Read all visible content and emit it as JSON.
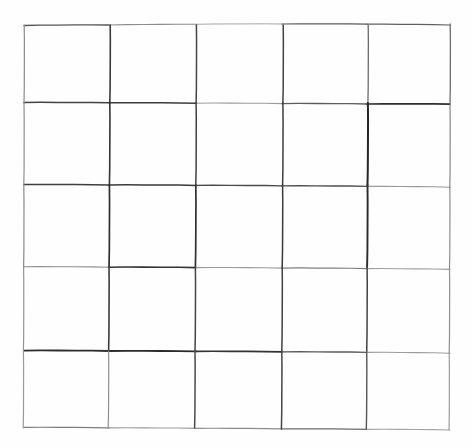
{
  "document": {
    "title": "Hand-drawn 5x5 grid",
    "description": "A blank hand-drawn square grid on white paper",
    "background_color": "#fefefe",
    "ink_color": "#2b2b2b",
    "light_ink_color": "#8a8a8a",
    "canvas": {
      "width": 471,
      "height": 448
    }
  },
  "grid": {
    "rows": 5,
    "columns": 5,
    "cell_count": 25,
    "bounds": {
      "left": 24,
      "top": 25,
      "right": 450,
      "bottom": 429
    },
    "horizontal_lines": [
      {
        "id": "h0",
        "name": "top-border",
        "y_left": 25,
        "y_right": 24,
        "width": 1.2,
        "color": "#6f6f6f",
        "segments": [
          {
            "x1": 24,
            "x2": 109,
            "y1": 25.5,
            "y2": 25.0,
            "width": 1.3,
            "color": "#555555"
          },
          {
            "x1": 109,
            "x2": 196,
            "y1": 25.0,
            "y2": 24.3,
            "width": 1.1,
            "color": "#8d8d8d"
          },
          {
            "x1": 196,
            "x2": 282,
            "y1": 24.3,
            "y2": 24.0,
            "width": 1.0,
            "color": "#a8a8a8"
          },
          {
            "x1": 282,
            "x2": 367,
            "y1": 24.0,
            "y2": 24.2,
            "width": 1.2,
            "color": "#5a5a5a"
          },
          {
            "x1": 367,
            "x2": 450,
            "y1": 24.2,
            "y2": 25.0,
            "width": 1.2,
            "color": "#5f5f5f"
          }
        ]
      },
      {
        "id": "h1",
        "name": "row1-row2-divider",
        "y_left": 103,
        "y_right": 104,
        "width": 1.6,
        "color": "#3a3a3a",
        "segments": [
          {
            "x1": 24,
            "x2": 109,
            "y1": 102.5,
            "y2": 102.8,
            "width": 1.5,
            "color": "#444444"
          },
          {
            "x1": 109,
            "x2": 196,
            "y1": 102.8,
            "y2": 103.2,
            "width": 1.5,
            "color": "#3c3c3c"
          },
          {
            "x1": 196,
            "x2": 282,
            "y1": 103.2,
            "y2": 103.6,
            "width": 1.1,
            "color": "#9c9c9c"
          },
          {
            "x1": 282,
            "x2": 367,
            "y1": 103.6,
            "y2": 104.0,
            "width": 1.3,
            "color": "#5c5c5c"
          },
          {
            "x1": 367,
            "x2": 450,
            "y1": 104.0,
            "y2": 104.2,
            "width": 1.7,
            "color": "#2f2f2f"
          }
        ]
      },
      {
        "id": "h2",
        "name": "row2-row3-divider",
        "y_left": 185,
        "y_right": 187,
        "width": 1.6,
        "color": "#3a3a3a",
        "segments": [
          {
            "x1": 24,
            "x2": 109,
            "y1": 184.5,
            "y2": 185.0,
            "width": 1.5,
            "color": "#3e3e3e"
          },
          {
            "x1": 109,
            "x2": 196,
            "y1": 185.0,
            "y2": 185.4,
            "width": 1.5,
            "color": "#3a3a3a"
          },
          {
            "x1": 196,
            "x2": 282,
            "y1": 185.4,
            "y2": 185.9,
            "width": 1.4,
            "color": "#4a4a4a"
          },
          {
            "x1": 282,
            "x2": 367,
            "y1": 185.9,
            "y2": 186.4,
            "width": 1.4,
            "color": "#4e4e4e"
          },
          {
            "x1": 367,
            "x2": 450,
            "y1": 186.4,
            "y2": 187.2,
            "width": 1.1,
            "color": "#9a9a9a"
          }
        ]
      },
      {
        "id": "h3",
        "name": "row3-row4-divider",
        "y_left": 267,
        "y_right": 269,
        "width": 1.5,
        "color": "#444444",
        "segments": [
          {
            "x1": 24,
            "x2": 109,
            "y1": 266.8,
            "y2": 267.2,
            "width": 1.1,
            "color": "#8e8e8e"
          },
          {
            "x1": 109,
            "x2": 196,
            "y1": 267.2,
            "y2": 267.6,
            "width": 1.6,
            "color": "#333333"
          },
          {
            "x1": 196,
            "x2": 282,
            "y1": 267.6,
            "y2": 268.1,
            "width": 1.1,
            "color": "#9b9b9b"
          },
          {
            "x1": 282,
            "x2": 367,
            "y1": 268.1,
            "y2": 268.6,
            "width": 1.2,
            "color": "#7d7d7d"
          },
          {
            "x1": 367,
            "x2": 450,
            "y1": 268.6,
            "y2": 269.4,
            "width": 1.1,
            "color": "#9f9f9f"
          }
        ]
      },
      {
        "id": "h4",
        "name": "row4-row5-divider",
        "y_left": 351,
        "y_right": 353,
        "width": 1.8,
        "color": "#2e2e2e",
        "segments": [
          {
            "x1": 24,
            "x2": 109,
            "y1": 350.6,
            "y2": 351.0,
            "width": 1.8,
            "color": "#2c2c2c"
          },
          {
            "x1": 109,
            "x2": 196,
            "y1": 351.0,
            "y2": 351.4,
            "width": 1.8,
            "color": "#2a2a2a"
          },
          {
            "x1": 196,
            "x2": 282,
            "y1": 351.4,
            "y2": 351.9,
            "width": 1.7,
            "color": "#333333"
          },
          {
            "x1": 282,
            "x2": 367,
            "y1": 351.9,
            "y2": 352.4,
            "width": 1.4,
            "color": "#5b5b5b"
          },
          {
            "x1": 367,
            "x2": 450,
            "y1": 352.4,
            "y2": 353.2,
            "width": 1.1,
            "color": "#9d9d9d"
          }
        ]
      },
      {
        "id": "h5",
        "name": "bottom-border",
        "y_left": 428,
        "y_right": 430,
        "width": 1.2,
        "color": "#8a8a8a",
        "segments": [
          {
            "x1": 24,
            "x2": 109,
            "y1": 427.4,
            "y2": 427.9,
            "width": 1.2,
            "color": "#7c7c7c"
          },
          {
            "x1": 109,
            "x2": 196,
            "y1": 427.9,
            "y2": 428.4,
            "width": 1.1,
            "color": "#9a9a9a"
          },
          {
            "x1": 196,
            "x2": 282,
            "y1": 428.4,
            "y2": 428.9,
            "width": 1.2,
            "color": "#8b8b8b"
          },
          {
            "x1": 282,
            "x2": 367,
            "y1": 428.9,
            "y2": 429.4,
            "width": 1.3,
            "color": "#6c6c6c"
          },
          {
            "x1": 367,
            "x2": 450,
            "y1": 429.4,
            "y2": 430.0,
            "width": 1.1,
            "color": "#a5a5a5"
          }
        ]
      }
    ],
    "vertical_lines": [
      {
        "id": "v0",
        "name": "left-border",
        "x_top": 24,
        "x_bottom": 23,
        "width": 1.2,
        "color": "#8d8d8d",
        "segments": [
          {
            "y1": 25,
            "y2": 103,
            "x1": 24.2,
            "x2": 24.0,
            "width": 1.2,
            "color": "#8b8b8b"
          },
          {
            "y1": 103,
            "y2": 185,
            "x1": 24.0,
            "x2": 23.8,
            "width": 1.2,
            "color": "#8f8f8f"
          },
          {
            "y1": 185,
            "y2": 267,
            "x1": 23.8,
            "x2": 23.6,
            "width": 1.2,
            "color": "#8a8a8a"
          },
          {
            "y1": 267,
            "y2": 351,
            "x1": 23.6,
            "x2": 23.4,
            "width": 1.2,
            "color": "#949494"
          },
          {
            "y1": 351,
            "y2": 428,
            "x1": 23.4,
            "x2": 23.2,
            "width": 1.2,
            "color": "#9a9a9a"
          }
        ]
      },
      {
        "id": "v1",
        "name": "col1-col2-divider",
        "x_top": 110,
        "x_bottom": 108,
        "width": 1.6,
        "color": "#383838",
        "segments": [
          {
            "y1": 25,
            "y2": 103,
            "x1": 110.2,
            "x2": 109.8,
            "width": 1.6,
            "color": "#3a3a3a"
          },
          {
            "y1": 103,
            "y2": 185,
            "x1": 109.8,
            "x2": 109.4,
            "width": 1.6,
            "color": "#343434"
          },
          {
            "y1": 185,
            "y2": 267,
            "x1": 109.4,
            "x2": 109.0,
            "width": 1.7,
            "color": "#2f2f2f"
          },
          {
            "y1": 267,
            "y2": 351,
            "x1": 109.0,
            "x2": 108.6,
            "width": 1.6,
            "color": "#3b3b3b"
          },
          {
            "y1": 351,
            "y2": 428,
            "x1": 108.6,
            "x2": 108.2,
            "width": 1.2,
            "color": "#909090"
          }
        ]
      },
      {
        "id": "v2",
        "name": "col2-col3-divider",
        "x_top": 196,
        "x_bottom": 195,
        "width": 1.5,
        "color": "#414141",
        "segments": [
          {
            "y1": 25,
            "y2": 103,
            "x1": 196.4,
            "x2": 196.1,
            "width": 1.5,
            "color": "#454545"
          },
          {
            "y1": 103,
            "y2": 185,
            "x1": 196.1,
            "x2": 195.8,
            "width": 1.5,
            "color": "#3f3f3f"
          },
          {
            "y1": 185,
            "y2": 267,
            "x1": 195.8,
            "x2": 195.4,
            "width": 1.7,
            "color": "#303030"
          },
          {
            "y1": 267,
            "y2": 351,
            "x1": 195.4,
            "x2": 195.0,
            "width": 1.5,
            "color": "#444444"
          },
          {
            "y1": 351,
            "y2": 428,
            "x1": 195.0,
            "x2": 194.6,
            "width": 1.5,
            "color": "#4a4a4a"
          }
        ]
      },
      {
        "id": "v3",
        "name": "col3-col4-divider",
        "x_top": 283,
        "x_bottom": 281,
        "width": 1.5,
        "color": "#3e3e3e",
        "segments": [
          {
            "y1": 25,
            "y2": 103,
            "x1": 283.2,
            "x2": 282.9,
            "width": 1.5,
            "color": "#424242"
          },
          {
            "y1": 103,
            "y2": 185,
            "x1": 282.9,
            "x2": 282.6,
            "width": 1.5,
            "color": "#3d3d3d"
          },
          {
            "y1": 185,
            "y2": 267,
            "x1": 282.6,
            "x2": 282.2,
            "width": 1.5,
            "color": "#3a3a3a"
          },
          {
            "y1": 267,
            "y2": 351,
            "x1": 282.2,
            "x2": 281.8,
            "width": 1.5,
            "color": "#404040"
          },
          {
            "y1": 351,
            "y2": 429,
            "x1": 281.8,
            "x2": 281.4,
            "width": 1.5,
            "color": "#454545"
          }
        ]
      },
      {
        "id": "v4",
        "name": "col4-col5-divider",
        "x_top": 368,
        "x_bottom": 366,
        "width": 1.7,
        "color": "#303030",
        "segments": [
          {
            "y1": 25,
            "y2": 103,
            "x1": 368.2,
            "x2": 367.9,
            "width": 1.3,
            "color": "#6a6a6a"
          },
          {
            "y1": 103,
            "y2": 185,
            "x1": 367.9,
            "x2": 367.5,
            "width": 2.0,
            "color": "#262626"
          },
          {
            "y1": 185,
            "y2": 267,
            "x1": 367.5,
            "x2": 367.1,
            "width": 1.9,
            "color": "#2a2a2a"
          },
          {
            "y1": 267,
            "y2": 351,
            "x1": 367.1,
            "x2": 366.7,
            "width": 1.5,
            "color": "#424242"
          },
          {
            "y1": 351,
            "y2": 429,
            "x1": 366.7,
            "x2": 366.3,
            "width": 1.4,
            "color": "#565656"
          }
        ]
      },
      {
        "id": "v5",
        "name": "right-border",
        "x_top": 450,
        "x_bottom": 449,
        "width": 1.2,
        "color": "#7f7f7f",
        "segments": [
          {
            "y1": 24,
            "y2": 104,
            "x1": 450.2,
            "x2": 450.0,
            "width": 1.3,
            "color": "#6d6d6d"
          },
          {
            "y1": 104,
            "y2": 187,
            "x1": 450.0,
            "x2": 449.8,
            "width": 1.2,
            "color": "#858585"
          },
          {
            "y1": 187,
            "y2": 269,
            "x1": 449.8,
            "x2": 449.5,
            "width": 1.2,
            "color": "#8c8c8c"
          },
          {
            "y1": 269,
            "y2": 353,
            "x1": 449.5,
            "x2": 449.2,
            "width": 1.2,
            "color": "#8f8f8f"
          },
          {
            "y1": 353,
            "y2": 430,
            "x1": 449.2,
            "x2": 449.0,
            "width": 1.2,
            "color": "#9b9b9b"
          }
        ]
      }
    ],
    "cells": [
      {
        "row": 1,
        "col": 1,
        "label": ""
      },
      {
        "row": 1,
        "col": 2,
        "label": ""
      },
      {
        "row": 1,
        "col": 3,
        "label": ""
      },
      {
        "row": 1,
        "col": 4,
        "label": ""
      },
      {
        "row": 1,
        "col": 5,
        "label": ""
      },
      {
        "row": 2,
        "col": 1,
        "label": ""
      },
      {
        "row": 2,
        "col": 2,
        "label": ""
      },
      {
        "row": 2,
        "col": 3,
        "label": ""
      },
      {
        "row": 2,
        "col": 4,
        "label": ""
      },
      {
        "row": 2,
        "col": 5,
        "label": ""
      },
      {
        "row": 3,
        "col": 1,
        "label": ""
      },
      {
        "row": 3,
        "col": 2,
        "label": ""
      },
      {
        "row": 3,
        "col": 3,
        "label": ""
      },
      {
        "row": 3,
        "col": 4,
        "label": ""
      },
      {
        "row": 3,
        "col": 5,
        "label": ""
      },
      {
        "row": 4,
        "col": 1,
        "label": ""
      },
      {
        "row": 4,
        "col": 2,
        "label": ""
      },
      {
        "row": 4,
        "col": 3,
        "label": ""
      },
      {
        "row": 4,
        "col": 4,
        "label": ""
      },
      {
        "row": 4,
        "col": 5,
        "label": ""
      },
      {
        "row": 5,
        "col": 1,
        "label": ""
      },
      {
        "row": 5,
        "col": 2,
        "label": ""
      },
      {
        "row": 5,
        "col": 3,
        "label": ""
      },
      {
        "row": 5,
        "col": 4,
        "label": ""
      },
      {
        "row": 5,
        "col": 5,
        "label": ""
      }
    ]
  }
}
